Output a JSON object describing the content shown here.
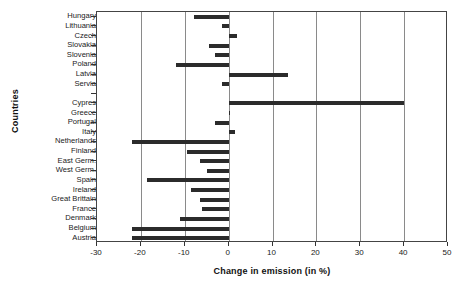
{
  "chart_data": {
    "type": "bar",
    "orientation": "horizontal",
    "title": "",
    "xlabel": "Change in emission (in %)",
    "ylabel": "Countries",
    "xlim": [
      -30,
      50
    ],
    "ylim": [
      0,
      23
    ],
    "xticks": [
      -30,
      -20,
      -10,
      0,
      10,
      20,
      30,
      40,
      50
    ],
    "xticklabels": [
      "-30",
      "-20",
      "-10",
      "0",
      "10",
      "20",
      "30",
      "40",
      "50"
    ],
    "grid": "vertical",
    "legend": null,
    "bar_color": "#2b2b2b",
    "categories": [
      "Hungary",
      "Lithuania",
      "Czech",
      "Slovakia",
      "Slovenia",
      "Poland",
      "Latvia",
      "Servia",
      "",
      "Cypres",
      "Greece",
      "Portugal",
      "Italy",
      "Netherlands",
      "Finland",
      "East Germ.",
      "West Germ.",
      "Spain",
      "Ireland",
      "Great Brittain",
      "France",
      "Denmark",
      "Belgium",
      "Austria"
    ],
    "values": [
      -8.0,
      -1.5,
      2.0,
      -4.5,
      -3.0,
      -12.0,
      13.6,
      -1.5,
      null,
      40.0,
      0.0,
      -3.0,
      1.5,
      -22.0,
      -9.5,
      -6.5,
      -5.0,
      -18.5,
      -8.5,
      -6.5,
      -6.0,
      -11.0,
      -22.0,
      -22.0
    ]
  }
}
